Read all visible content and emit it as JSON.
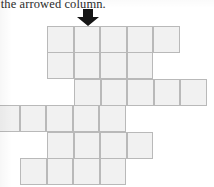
{
  "caption": {
    "text": "l the arrowed column.",
    "note": "text is clipped at the left edge of the scan"
  },
  "arrow": {
    "icon": "arrow-down-icon",
    "color": "#151515",
    "points_at_column_index": 1
  },
  "grid": {
    "cell_width": 26.6,
    "cell_height": 26.5,
    "fill_color": "#f1f1f1",
    "line_color": "#b9b9b9",
    "rows": [
      {
        "label": "row-1",
        "top": 26,
        "left": 47,
        "columns": 5,
        "clipped_left": false,
        "clipped_right": false
      },
      {
        "label": "row-2",
        "top": 52,
        "left": 47,
        "columns": 4,
        "clipped_left": false,
        "clipped_right": false
      },
      {
        "label": "row-3",
        "top": 79,
        "left": 74,
        "columns": 5,
        "clipped_left": false,
        "clipped_right": true
      },
      {
        "label": "row-4",
        "top": 105,
        "left": -7,
        "columns": 5,
        "clipped_left": true,
        "clipped_right": false
      },
      {
        "label": "row-5",
        "top": 132,
        "left": 47,
        "columns": 4,
        "clipped_left": false,
        "clipped_right": false
      },
      {
        "label": "row-6",
        "top": 158,
        "left": 20,
        "columns": 4,
        "clipped_left": false,
        "clipped_right": false
      }
    ]
  }
}
